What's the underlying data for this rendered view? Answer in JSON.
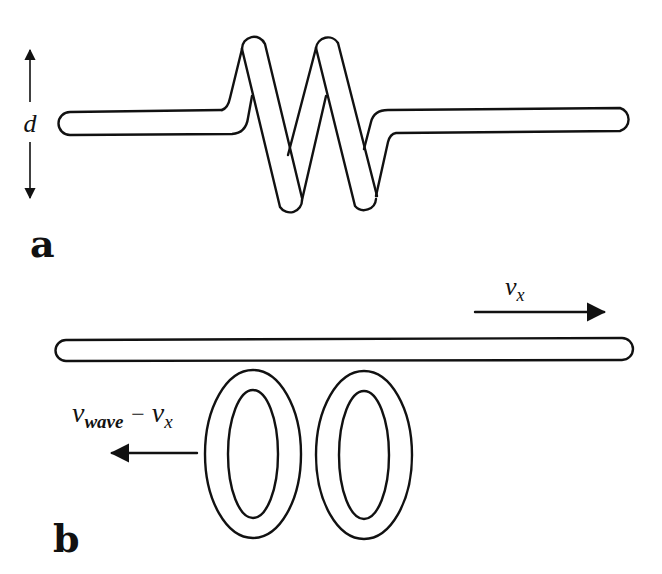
{
  "figure": {
    "panels": [
      {
        "id": "a",
        "label": "a",
        "description": "Twisted (zigzag) tube segment with vertical extent d",
        "dimension_label": "d"
      },
      {
        "id": "b",
        "label": "b",
        "description": "Straight tube moving right with velocity v_x, with two ring loops moving left",
        "velocity_right": {
          "symbol": "v",
          "subscript": "x"
        },
        "velocity_left": {
          "symbol_1": "v",
          "subscript_1": "wave",
          "operator": "−",
          "symbol_2": "v",
          "subscript_2": "x"
        }
      }
    ],
    "colors": {
      "ink": "#111111",
      "background": "#ffffff"
    }
  }
}
